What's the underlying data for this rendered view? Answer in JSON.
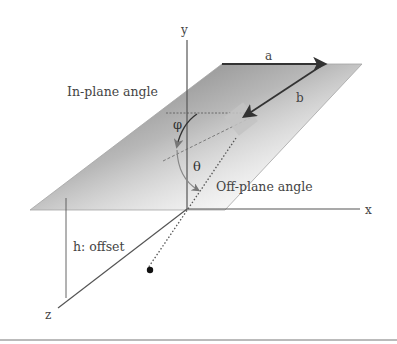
{
  "diagram": {
    "axes": {
      "x": "x",
      "y": "y",
      "z": "z"
    },
    "labels": {
      "in_plane": "In-plane angle",
      "off_plane": "Off-plane angle",
      "offset": "h: offset",
      "a": "a",
      "b": "b",
      "phi": "φ",
      "theta": "θ"
    },
    "colors": {
      "axis": "#555555",
      "plane_edge": "#9a9a9a",
      "plane_shade_dark": "#8a8a8a",
      "arrow": "#3a3a3a",
      "marker": "#c8c8c8",
      "point": "#111111"
    }
  }
}
